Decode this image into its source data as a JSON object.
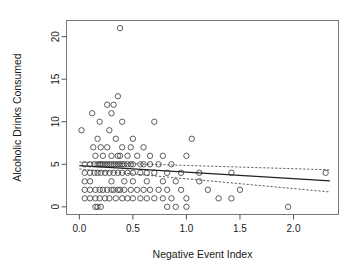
{
  "chart_data": {
    "type": "scatter",
    "title": "",
    "xlabel": "Negative Event Index",
    "ylabel": "Alcoholic Drinks Consumed",
    "xlim": [
      -0.12,
      2.42
    ],
    "ylim": [
      -0.9,
      21.9
    ],
    "xticks": [
      0.0,
      0.5,
      1.0,
      1.5,
      2.0
    ],
    "xticklabels": [
      "0.0",
      "0.5",
      "1.0",
      "1.5",
      "2.0"
    ],
    "yticks": [
      0,
      5,
      10,
      15,
      20
    ],
    "yticklabels": [
      "0",
      "5",
      "10",
      "15",
      "20"
    ],
    "grid": false,
    "legend": null,
    "marker": "open-circle",
    "points": [
      [
        0.02,
        9.0
      ],
      [
        0.05,
        5.0
      ],
      [
        0.05,
        4.0
      ],
      [
        0.05,
        3.0
      ],
      [
        0.05,
        2.0
      ],
      [
        0.05,
        1.0
      ],
      [
        0.1,
        5.0
      ],
      [
        0.1,
        4.0
      ],
      [
        0.1,
        3.0
      ],
      [
        0.1,
        2.0
      ],
      [
        0.1,
        1.0
      ],
      [
        0.12,
        11.0
      ],
      [
        0.13,
        7.0
      ],
      [
        0.14,
        5.0
      ],
      [
        0.14,
        4.0
      ],
      [
        0.15,
        6.0
      ],
      [
        0.15,
        2.0
      ],
      [
        0.15,
        1.0
      ],
      [
        0.15,
        0.0
      ],
      [
        0.17,
        8.0
      ],
      [
        0.17,
        5.0
      ],
      [
        0.17,
        4.0
      ],
      [
        0.17,
        0.0
      ],
      [
        0.19,
        10.0
      ],
      [
        0.19,
        5.0
      ],
      [
        0.19,
        2.0
      ],
      [
        0.19,
        1.0
      ],
      [
        0.2,
        7.0
      ],
      [
        0.2,
        5.0
      ],
      [
        0.2,
        4.0
      ],
      [
        0.2,
        0.0
      ],
      [
        0.22,
        6.0
      ],
      [
        0.22,
        5.0
      ],
      [
        0.22,
        2.0
      ],
      [
        0.24,
        5.0
      ],
      [
        0.24,
        4.0
      ],
      [
        0.24,
        1.0
      ],
      [
        0.26,
        12.0
      ],
      [
        0.26,
        7.0
      ],
      [
        0.26,
        5.0
      ],
      [
        0.26,
        2.0
      ],
      [
        0.28,
        9.0
      ],
      [
        0.28,
        5.0
      ],
      [
        0.28,
        4.0
      ],
      [
        0.28,
        1.0
      ],
      [
        0.3,
        11.0
      ],
      [
        0.3,
        6.0
      ],
      [
        0.3,
        5.0
      ],
      [
        0.3,
        3.0
      ],
      [
        0.3,
        2.0
      ],
      [
        0.32,
        12.0
      ],
      [
        0.32,
        5.0
      ],
      [
        0.32,
        4.0
      ],
      [
        0.32,
        2.0
      ],
      [
        0.34,
        8.0
      ],
      [
        0.34,
        5.0
      ],
      [
        0.34,
        1.0
      ],
      [
        0.36,
        13.0
      ],
      [
        0.36,
        6.0
      ],
      [
        0.36,
        5.0
      ],
      [
        0.36,
        4.0
      ],
      [
        0.36,
        2.0
      ],
      [
        0.38,
        21.0
      ],
      [
        0.38,
        6.0
      ],
      [
        0.38,
        5.0
      ],
      [
        0.38,
        2.0
      ],
      [
        0.4,
        10.0
      ],
      [
        0.4,
        7.0
      ],
      [
        0.4,
        5.0
      ],
      [
        0.4,
        4.0
      ],
      [
        0.4,
        1.0
      ],
      [
        0.42,
        5.0
      ],
      [
        0.42,
        3.0
      ],
      [
        0.42,
        2.0
      ],
      [
        0.45,
        6.0
      ],
      [
        0.45,
        5.0
      ],
      [
        0.45,
        4.0
      ],
      [
        0.45,
        1.0
      ],
      [
        0.48,
        7.0
      ],
      [
        0.48,
        5.0
      ],
      [
        0.48,
        2.0
      ],
      [
        0.5,
        8.0
      ],
      [
        0.5,
        5.0
      ],
      [
        0.5,
        4.0
      ],
      [
        0.5,
        3.0
      ],
      [
        0.5,
        1.0
      ],
      [
        0.54,
        6.0
      ],
      [
        0.54,
        2.0
      ],
      [
        0.57,
        5.0
      ],
      [
        0.57,
        4.0
      ],
      [
        0.57,
        1.0
      ],
      [
        0.6,
        7.0
      ],
      [
        0.6,
        5.0
      ],
      [
        0.6,
        2.0
      ],
      [
        0.63,
        4.0
      ],
      [
        0.63,
        3.0
      ],
      [
        0.63,
        1.0
      ],
      [
        0.66,
        6.0
      ],
      [
        0.66,
        5.0
      ],
      [
        0.66,
        2.0
      ],
      [
        0.7,
        10.0
      ],
      [
        0.7,
        4.0
      ],
      [
        0.7,
        1.0
      ],
      [
        0.74,
        5.0
      ],
      [
        0.74,
        2.0
      ],
      [
        0.78,
        6.0
      ],
      [
        0.78,
        3.0
      ],
      [
        0.78,
        1.0
      ],
      [
        0.82,
        4.0
      ],
      [
        0.82,
        2.0
      ],
      [
        0.82,
        0.0
      ],
      [
        0.86,
        5.0
      ],
      [
        0.86,
        1.0
      ],
      [
        0.9,
        3.0
      ],
      [
        0.9,
        0.0
      ],
      [
        0.95,
        4.0
      ],
      [
        0.95,
        2.0
      ],
      [
        1.0,
        6.0
      ],
      [
        1.0,
        1.0
      ],
      [
        1.0,
        0.0
      ],
      [
        1.05,
        8.0
      ],
      [
        1.12,
        4.0
      ],
      [
        1.12,
        3.0
      ],
      [
        1.2,
        2.0
      ],
      [
        1.3,
        1.0
      ],
      [
        1.42,
        4.0
      ],
      [
        1.42,
        1.0
      ],
      [
        1.5,
        2.0
      ],
      [
        1.95,
        0.0
      ],
      [
        2.3,
        4.0
      ]
    ],
    "fit_line": {
      "label": "least-squares regression",
      "style": "solid",
      "x": [
        0.0,
        2.34
      ],
      "y": [
        4.85,
        3.05
      ]
    },
    "confidence_bands": [
      {
        "label": "upper confidence band",
        "style": "dotted",
        "x": [
          0.0,
          2.34
        ],
        "y": [
          5.25,
          4.35
        ]
      },
      {
        "label": "lower confidence band",
        "style": "dotted",
        "x": [
          0.0,
          2.34
        ],
        "y": [
          4.45,
          1.75
        ]
      }
    ]
  }
}
